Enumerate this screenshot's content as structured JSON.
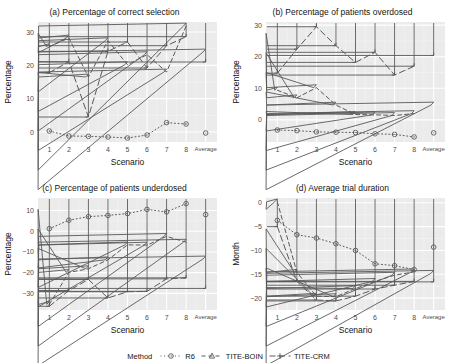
{
  "figure": {
    "background": "#ffffff",
    "panel_fill": "#ebebeb",
    "grid_major": "#ffffff",
    "grid_minor": "#f5f5f5",
    "axis_text_color": "#4d4d4d",
    "series_color": "#595959"
  },
  "legend": {
    "title": "Method",
    "entries": [
      {
        "label": "R6",
        "marker": "circle",
        "dash": "dotted"
      },
      {
        "label": "TITE-BOIN",
        "marker": "triangle",
        "dash": "dashed"
      },
      {
        "label": "TITE-CRM",
        "marker": "plus",
        "dash": "longdash"
      }
    ]
  },
  "chart_data": [
    {
      "type": "line",
      "panel": "a",
      "title": "(a) Percentage of correct selection",
      "xlabel": "Scenario",
      "ylabel": "Percentage",
      "categories": [
        "1",
        "2",
        "3",
        "4",
        "5",
        "6",
        "7",
        "8",
        "Average"
      ],
      "yticks": [
        0,
        10,
        20,
        30
      ],
      "ylim": [
        -3,
        33
      ],
      "grid": true,
      "legend_position": "bottom",
      "series": [
        {
          "name": "R6",
          "values": [
            0.3,
            -1.2,
            -1.3,
            -1.5,
            -1.8,
            -0.9,
            2.8,
            2.4,
            -0.3
          ]
        },
        {
          "name": "TITE-BOIN",
          "values": [
            25.6,
            28.2,
            16.5,
            27.4,
            20.2,
            23.2,
            18.0,
            31.8,
            24.0
          ]
        },
        {
          "name": "TITE-CRM",
          "values": [
            17.8,
            21.1,
            4.5,
            24.2,
            27.0,
            19.2,
            25.9,
            28.6,
            21.0
          ]
        }
      ]
    },
    {
      "type": "line",
      "panel": "b",
      "title": "(b) Percentage of patients overdosed",
      "xlabel": "Scenario",
      "ylabel": "Percentage",
      "categories": [
        "1",
        "2",
        "3",
        "4",
        "5",
        "6",
        "7",
        "8",
        "Average"
      ],
      "yticks": [
        0,
        10,
        20,
        30
      ],
      "ylim": [
        -7,
        31
      ],
      "grid": true,
      "legend_position": "bottom",
      "series": [
        {
          "name": "R6",
          "values": [
            -3.2,
            -3.4,
            -3.8,
            -3.9,
            -4.0,
            -4.4,
            -4.6,
            -5.4,
            -4.1
          ]
        },
        {
          "name": "TITE-BOIN",
          "values": [
            9.4,
            7.0,
            10.2,
            4.7,
            1.7,
            1.6,
            1.4,
            2.0,
            4.7
          ]
        },
        {
          "name": "TITE-CRM",
          "values": [
            14.8,
            22.4,
            29.5,
            23.5,
            18.2,
            21.4,
            14.2,
            17.0,
            20.4
          ]
        }
      ]
    },
    {
      "type": "line",
      "panel": "c",
      "title": "(c) Percentage of patients underdosed",
      "xlabel": "Scenario",
      "ylabel": "Percentage",
      "categories": [
        "1",
        "2",
        "3",
        "4",
        "5",
        "6",
        "7",
        "8",
        "Average"
      ],
      "yticks": [
        -30,
        -20,
        -10,
        0,
        10
      ],
      "ylim": [
        -38,
        16
      ],
      "grid": true,
      "legend_position": "bottom",
      "series": [
        {
          "name": "R6",
          "values": [
            1.2,
            5.3,
            7.0,
            7.6,
            8.5,
            10.5,
            9.3,
            13.3,
            8.0
          ]
        },
        {
          "name": "TITE-BOIN",
          "values": [
            -35.3,
            -19.9,
            -18.1,
            -13.8,
            -6.6,
            -6.7,
            -2.5,
            -5.3,
            -13.4
          ]
        },
        {
          "name": "TITE-CRM",
          "values": [
            -36.2,
            -28.6,
            -23.3,
            -32.2,
            -29.2,
            -29.0,
            -23.0,
            -22.5,
            -27.6
          ]
        }
      ]
    },
    {
      "type": "line",
      "panel": "d",
      "title": "(d) Average trial duration",
      "xlabel": "Scenario",
      "ylabel": "Month",
      "categories": [
        "1",
        "2",
        "3",
        "4",
        "5",
        "6",
        "7",
        "8",
        "Average"
      ],
      "yticks": [
        -20,
        -15,
        -10,
        -5,
        0
      ],
      "ylim": [
        -22.5,
        1.0
      ],
      "grid": true,
      "legend_position": "bottom",
      "series": [
        {
          "name": "R6",
          "values": [
            -3.7,
            -6.7,
            -7.4,
            -8.6,
            -10.0,
            -12.8,
            -13.2,
            -14.0,
            -9.3
          ]
        },
        {
          "name": "TITE-BOIN",
          "values": [
            0.2,
            -14.6,
            -19.6,
            -19.7,
            -18.0,
            -16.5,
            -15.2,
            -14.5,
            -14.8
          ]
        },
        {
          "name": "TITE-CRM",
          "values": [
            -5.0,
            -16.5,
            -20.4,
            -20.6,
            -19.6,
            -18.1,
            -17.3,
            -16.5,
            -16.6
          ]
        }
      ]
    }
  ]
}
